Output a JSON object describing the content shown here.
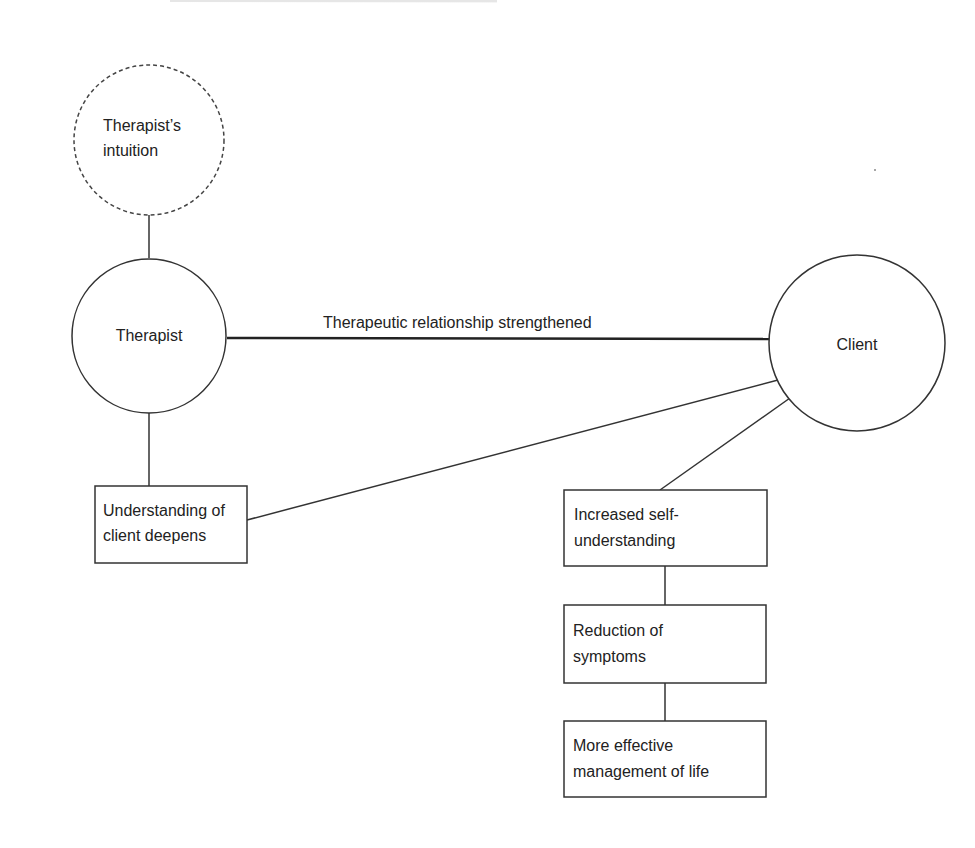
{
  "diagram": {
    "nodes": {
      "intuition": {
        "shape": "circle-dashed",
        "lines": [
          "Therapist’s",
          "intuition"
        ]
      },
      "therapist": {
        "shape": "circle",
        "lines": [
          "Therapist"
        ]
      },
      "client": {
        "shape": "circle",
        "lines": [
          "Client"
        ]
      },
      "understanding": {
        "shape": "box",
        "lines": [
          "Understanding of",
          "client deepens"
        ]
      },
      "self_understanding": {
        "shape": "box",
        "lines": [
          "Increased self-",
          "understanding"
        ]
      },
      "symptoms": {
        "shape": "box",
        "lines": [
          "Reduction of",
          "symptoms"
        ]
      },
      "management": {
        "shape": "box",
        "lines": [
          "More effective",
          "management of life"
        ]
      }
    },
    "edges": {
      "relationship": {
        "from": "therapist",
        "to": "client",
        "label": "Therapeutic relationship strengthened"
      },
      "intuition_therapist": {
        "from": "intuition",
        "to": "therapist"
      },
      "therapist_understanding": {
        "from": "therapist",
        "to": "understanding"
      },
      "understanding_client": {
        "from": "understanding",
        "to": "client"
      },
      "client_self": {
        "from": "client",
        "to": "self_understanding"
      },
      "self_symptoms": {
        "from": "self_understanding",
        "to": "symptoms"
      },
      "symptoms_management": {
        "from": "symptoms",
        "to": "management"
      }
    },
    "colors": {
      "stroke": "#333333",
      "text": "#222222",
      "background": "#ffffff"
    }
  }
}
